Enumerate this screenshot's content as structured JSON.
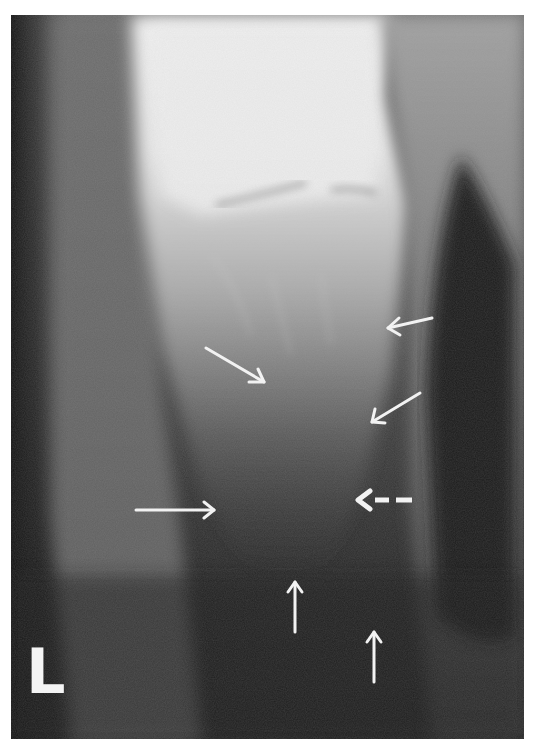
{
  "image": {
    "kind": "radiograph",
    "description": "Grayscale X-ray of a bone with white annotation arrows",
    "side_marker": "L",
    "colors": {
      "border": "#ffffff",
      "annotation": "#f2f2f2",
      "bone_bright": "#ececec",
      "soft_tissue": "#7a7a7a",
      "background_dark": "#1e1e1e"
    }
  },
  "annotations": {
    "arrows": [
      {
        "id": "arrow-1",
        "style": "solid",
        "direction": "down-right",
        "from": [
          206,
          348
        ],
        "to": [
          264,
          382
        ]
      },
      {
        "id": "arrow-2",
        "style": "solid",
        "direction": "left",
        "from": [
          432,
          318
        ],
        "to": [
          388,
          328
        ]
      },
      {
        "id": "arrow-3",
        "style": "solid",
        "direction": "down-left",
        "from": [
          420,
          393
        ],
        "to": [
          372,
          422
        ]
      },
      {
        "id": "arrow-4",
        "style": "solid",
        "direction": "right",
        "from": [
          136,
          510
        ],
        "to": [
          214,
          510
        ]
      },
      {
        "id": "arrow-5",
        "style": "dashed",
        "direction": "left",
        "from": [
          412,
          500
        ],
        "to": [
          358,
          500
        ]
      },
      {
        "id": "arrow-6",
        "style": "solid",
        "direction": "up",
        "from": [
          295,
          633
        ],
        "to": [
          295,
          582
        ]
      },
      {
        "id": "arrow-7",
        "style": "solid",
        "direction": "up",
        "from": [
          374,
          682
        ],
        "to": [
          374,
          632
        ]
      }
    ]
  }
}
